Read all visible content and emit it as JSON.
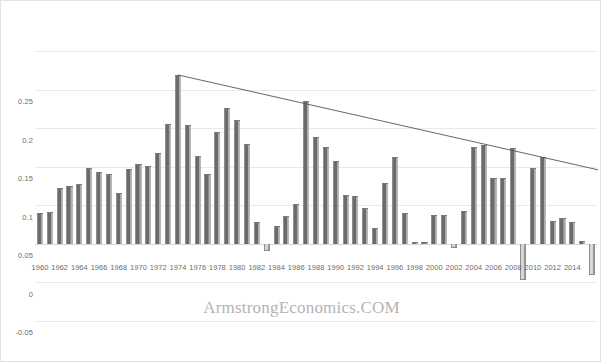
{
  "watermark": "ArmstrongEconomics.COM",
  "colors": {
    "bar": "#6b6b6b",
    "bar_negative": "#d8d8d8",
    "grid": "#e9e9e9",
    "trendline": "#555555",
    "axis_text": "#6d6d6d",
    "watermark": "#b4b4b4"
  },
  "chart_data": {
    "type": "bar",
    "title": "",
    "subtitle": "",
    "xlabel": "",
    "ylabel": "",
    "ylim": [
      -0.1,
      0.25
    ],
    "yticks": [
      0.25,
      0.2,
      0.15,
      0.1,
      0.05,
      0,
      -0.05,
      -0.1
    ],
    "ytick_labels": [
      "0.25",
      "0.2",
      "0.15",
      "0.1",
      "0.05",
      "0",
      "-0.05",
      "-0.1"
    ],
    "grid": true,
    "legend": "none",
    "xtick_labels": [
      "1960",
      "1962",
      "1964",
      "1966",
      "1968",
      "1970",
      "1972",
      "1974",
      "1976",
      "1978",
      "1980",
      "1982",
      "1984",
      "1986",
      "1988",
      "1990",
      "1992",
      "1994",
      "1996",
      "1998",
      "2000",
      "2002",
      "2004",
      "2006",
      "2008",
      "2010",
      "2012",
      "2014"
    ],
    "xtick_step": 2,
    "categories": [
      "1960",
      "1961",
      "1962",
      "1963",
      "1964",
      "1965",
      "1966",
      "1967",
      "1968",
      "1969",
      "1970",
      "1971",
      "1972",
      "1973",
      "1974",
      "1975",
      "1976",
      "1977",
      "1978",
      "1979",
      "1980",
      "1981",
      "1982",
      "1983",
      "1984",
      "1985",
      "1986",
      "1987",
      "1988",
      "1989",
      "1990",
      "1991",
      "1992",
      "1993",
      "1994",
      "1995",
      "1996",
      "1997",
      "1998",
      "1999",
      "2000",
      "2001",
      "2002",
      "2003",
      "2004",
      "2005",
      "2006",
      "2007",
      "2008",
      "2009",
      "2010",
      "2011",
      "2012",
      "2013",
      "2014",
      "2015",
      "2016"
    ],
    "values": [
      0.04,
      0.041,
      0.072,
      0.075,
      0.078,
      0.098,
      0.093,
      0.09,
      0.066,
      0.097,
      0.103,
      0.101,
      0.118,
      0.155,
      0.219,
      0.154,
      0.114,
      0.09,
      0.145,
      0.176,
      0.161,
      0.129,
      0.028,
      -0.009,
      0.023,
      0.036,
      0.052,
      0.185,
      0.139,
      0.125,
      0.108,
      0.063,
      0.062,
      0.046,
      0.02,
      0.079,
      0.113,
      0.04,
      0.003,
      0.003,
      0.038,
      0.037,
      -0.006,
      0.042,
      0.126,
      0.128,
      0.086,
      0.086,
      0.124,
      -0.047,
      0.098,
      0.113,
      0.03,
      0.034,
      0.028,
      0.004,
      -0.04
    ],
    "annotations": [
      {
        "type": "trendline",
        "from": {
          "x": "1974",
          "y": 0.219
        },
        "to": {
          "x": "2016",
          "y": 0.096
        },
        "style": "declining-resistance"
      }
    ]
  }
}
